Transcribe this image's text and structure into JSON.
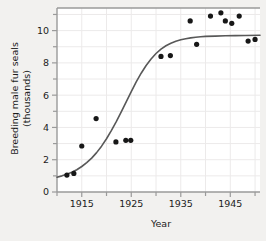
{
  "chart_data": {
    "type": "scatter",
    "title": "",
    "subtitle": "",
    "xlabel": "Year",
    "ylabel": "Breeding male fur seals (thousands)",
    "ylabel_line1": "Breeding male fur seals",
    "ylabel_line2": "(thousands)",
    "xlim": [
      1910,
      1951
    ],
    "ylim": [
      0,
      11.4
    ],
    "xticks_major": [
      1915,
      1925,
      1935,
      1945
    ],
    "xticks_major_labels": [
      "1915",
      "1925",
      "1935",
      "1945"
    ],
    "xticks_minor": [
      1910,
      1920,
      1930,
      1940,
      1950
    ],
    "yticks_major": [
      0,
      2,
      4,
      6,
      8,
      10
    ],
    "yticks_major_labels": [
      "0",
      "2",
      "4",
      "6",
      "8",
      "10"
    ],
    "yticks_minor": [
      1,
      3,
      5,
      7,
      9,
      11
    ],
    "grid": true,
    "legend": "none",
    "series": [
      {
        "name": "Breeding male fur seals",
        "marker": "filled-circle",
        "color": "#171717",
        "points": [
          {
            "x": 1912.0,
            "y": 1.05
          },
          {
            "x": 1913.4,
            "y": 1.15
          },
          {
            "x": 1915.0,
            "y": 2.85
          },
          {
            "x": 1917.9,
            "y": 4.55
          },
          {
            "x": 1921.9,
            "y": 3.1
          },
          {
            "x": 1923.9,
            "y": 3.2
          },
          {
            "x": 1924.9,
            "y": 3.2
          },
          {
            "x": 1931.0,
            "y": 8.4
          },
          {
            "x": 1932.9,
            "y": 8.45
          },
          {
            "x": 1936.9,
            "y": 10.6
          },
          {
            "x": 1938.2,
            "y": 9.15
          },
          {
            "x": 1941.0,
            "y": 10.9
          },
          {
            "x": 1943.1,
            "y": 11.1
          },
          {
            "x": 1944.0,
            "y": 10.6
          },
          {
            "x": 1945.3,
            "y": 10.45
          },
          {
            "x": 1946.8,
            "y": 10.9
          },
          {
            "x": 1948.6,
            "y": 9.35
          },
          {
            "x": 1950.0,
            "y": 9.45
          }
        ]
      }
    ],
    "fit_curve": {
      "name": "logistic fit",
      "color": "#585858",
      "points": [
        {
          "x": 1910.0,
          "y": 0.92
        },
        {
          "x": 1911.0,
          "y": 1.0
        },
        {
          "x": 1912.0,
          "y": 1.1
        },
        {
          "x": 1913.0,
          "y": 1.22
        },
        {
          "x": 1914.0,
          "y": 1.38
        },
        {
          "x": 1915.0,
          "y": 1.58
        },
        {
          "x": 1916.0,
          "y": 1.82
        },
        {
          "x": 1917.0,
          "y": 2.1
        },
        {
          "x": 1918.0,
          "y": 2.44
        },
        {
          "x": 1919.0,
          "y": 2.84
        },
        {
          "x": 1920.0,
          "y": 3.3
        },
        {
          "x": 1921.0,
          "y": 3.82
        },
        {
          "x": 1922.0,
          "y": 4.38
        },
        {
          "x": 1923.0,
          "y": 4.98
        },
        {
          "x": 1924.0,
          "y": 5.6
        },
        {
          "x": 1925.0,
          "y": 6.22
        },
        {
          "x": 1926.0,
          "y": 6.82
        },
        {
          "x": 1927.0,
          "y": 7.36
        },
        {
          "x": 1928.0,
          "y": 7.84
        },
        {
          "x": 1929.0,
          "y": 8.24
        },
        {
          "x": 1930.0,
          "y": 8.58
        },
        {
          "x": 1931.0,
          "y": 8.85
        },
        {
          "x": 1932.0,
          "y": 9.06
        },
        {
          "x": 1933.0,
          "y": 9.22
        },
        {
          "x": 1934.0,
          "y": 9.34
        },
        {
          "x": 1935.0,
          "y": 9.43
        },
        {
          "x": 1936.0,
          "y": 9.5
        },
        {
          "x": 1937.0,
          "y": 9.55
        },
        {
          "x": 1938.0,
          "y": 9.59
        },
        {
          "x": 1939.0,
          "y": 9.62
        },
        {
          "x": 1940.0,
          "y": 9.64
        },
        {
          "x": 1942.0,
          "y": 9.66
        },
        {
          "x": 1944.0,
          "y": 9.68
        },
        {
          "x": 1946.0,
          "y": 9.69
        },
        {
          "x": 1948.0,
          "y": 9.7
        },
        {
          "x": 1951.0,
          "y": 9.71
        }
      ]
    }
  },
  "colors": {
    "page_background": "#f2f1ef",
    "panel_background": "#ffffff",
    "grid": "#eceaea",
    "axis": "#9a9a9a",
    "text": "#1c1c1c",
    "point": "#171717",
    "curve": "#585858"
  }
}
